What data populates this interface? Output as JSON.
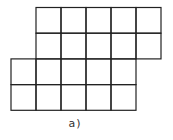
{
  "figure": {
    "caption": "a)",
    "grid": {
      "cell_size": 25,
      "line_color": "#222222",
      "top_block": {
        "cols": 5,
        "rows": 2,
        "x": 36,
        "y": 7
      },
      "middle_block": {
        "cols": 5,
        "rows": 1,
        "x": 11,
        "y": 59
      },
      "bottom_block": {
        "cols": 5,
        "rows": 1,
        "x": 11,
        "y": 84
      },
      "shape_cells": [
        [
          1,
          0
        ],
        [
          2,
          0
        ],
        [
          3,
          0
        ],
        [
          4,
          0
        ],
        [
          5,
          0
        ],
        [
          1,
          1
        ],
        [
          2,
          1
        ],
        [
          3,
          1
        ],
        [
          4,
          1
        ],
        [
          5,
          1
        ],
        [
          0,
          2
        ],
        [
          1,
          2
        ],
        [
          2,
          2
        ],
        [
          3,
          2
        ],
        [
          4,
          2
        ],
        [
          0,
          3
        ],
        [
          1,
          3
        ],
        [
          2,
          3
        ],
        [
          3,
          3
        ],
        [
          4,
          3
        ]
      ]
    }
  }
}
